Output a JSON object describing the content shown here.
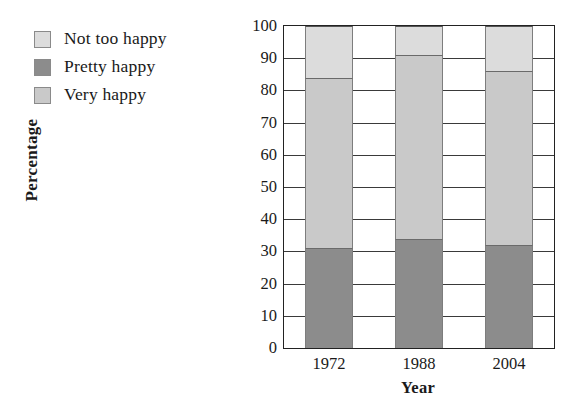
{
  "chart_data": {
    "type": "bar",
    "subtype": "stacked-vertical",
    "title": "",
    "xlabel": "Year",
    "ylabel": "Percentage",
    "categories": [
      "1972",
      "1988",
      "2004"
    ],
    "ylim": [
      0,
      100
    ],
    "yticks": [
      0,
      10,
      20,
      30,
      40,
      50,
      60,
      70,
      80,
      90,
      100
    ],
    "ytick_labels": [
      "0",
      "10",
      "20",
      "30",
      "40",
      "50",
      "60",
      "70",
      "80",
      "90",
      "100"
    ],
    "grid": true,
    "grid_axis": "y",
    "legend_position": "top-left-outside",
    "stack_order_bottom_to_top": [
      "Pretty happy",
      "Very happy",
      "Not too happy"
    ],
    "series": [
      {
        "name": "Pretty happy",
        "color": "#8c8c8c",
        "values": [
          31,
          34,
          32
        ]
      },
      {
        "name": "Very happy",
        "color": "#c9c9c9",
        "values": [
          53,
          57,
          54
        ]
      },
      {
        "name": "Not too happy",
        "color": "#dcdcdc",
        "values": [
          16,
          9,
          14
        ]
      }
    ]
  },
  "legend": {
    "items": [
      {
        "label": "Not too happy",
        "color": "#dcdcdc"
      },
      {
        "label": "Pretty happy",
        "color": "#8c8c8c"
      },
      {
        "label": "Very happy",
        "color": "#c9c9c9"
      }
    ]
  },
  "axes": {
    "y_title": "Percentage",
    "x_title": "Year"
  },
  "colors": {
    "frame": "#222222",
    "gridline": "#3a3a3a",
    "text": "#1a1a1a",
    "background": "#ffffff"
  }
}
